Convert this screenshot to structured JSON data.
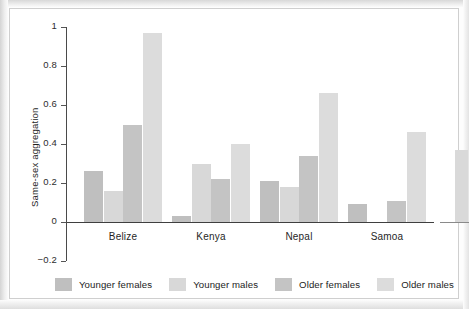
{
  "chart_data": {
    "type": "bar",
    "title": "",
    "subtitle": "",
    "xlabel": "",
    "ylabel": "Same-sex aggregation",
    "categories": [
      "Belize",
      "Kenya",
      "Nepal",
      "Samoa"
    ],
    "series": [
      {
        "name": "Younger females",
        "color": "#bfbfbf",
        "values": [
          0.26,
          0.03,
          0.21,
          0.09
        ]
      },
      {
        "name": "Younger males",
        "color": "#d8d8d8",
        "values": [
          0.16,
          0.3,
          0.18,
          0.0
        ]
      },
      {
        "name": "Older females",
        "color": "#c4c4c4",
        "values": [
          0.5,
          0.22,
          0.34,
          0.11
        ]
      },
      {
        "name": "Older males",
        "color": "#dcdcdc",
        "values": [
          0.97,
          0.4,
          0.66,
          0.46
        ]
      }
    ],
    "ylim": [
      -0.2,
      1
    ],
    "yticks": [
      1,
      0.8,
      0.6,
      0.4,
      0.2,
      0,
      -0.2
    ],
    "ytick_labels": [
      "1",
      "0.8",
      "0.6",
      "0.4",
      "0.2",
      "0",
      "−0.2"
    ],
    "grid": false,
    "legend_position": "bottom"
  },
  "legend": {
    "items": [
      {
        "label": "Younger females",
        "color": "#bfbfbf",
        "swatch_name": "legend-swatch-younger-females"
      },
      {
        "label": "Younger males",
        "color": "#d8d8d8",
        "swatch_name": "legend-swatch-younger-males"
      },
      {
        "label": "Older females",
        "color": "#c4c4c4",
        "swatch_name": "legend-swatch-older-females"
      },
      {
        "label": "Older males",
        "color": "#dcdcdc",
        "swatch_name": "legend-swatch-older-males"
      }
    ]
  },
  "axes": {
    "y_label": "Same-sex aggregation",
    "y_tick_labels": [
      "1",
      "0.8",
      "0.6",
      "0.4",
      "0.2",
      "0",
      "−0.2"
    ],
    "x_tick_labels": [
      "Belize",
      "Kenya",
      "Nepal",
      "Samoa"
    ]
  }
}
